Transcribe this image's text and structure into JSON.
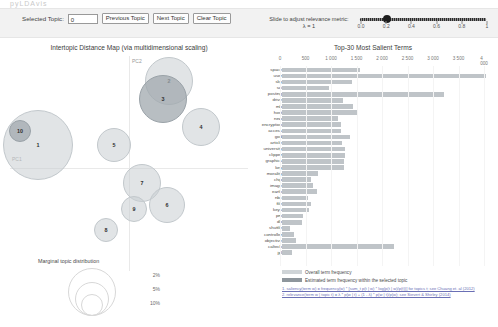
{
  "ghost_text": "pyLDAvis",
  "controls": {
    "selected_topic_label": "Selected Topic:",
    "selected_topic_value": "0",
    "previous_topic": "Previous Topic",
    "next_topic": "Next Topic",
    "clear_topic": "Clear Topic"
  },
  "slider": {
    "label": "Slide to adjust relevance metric:",
    "lambda_label": "λ = 1",
    "value": 1,
    "ticks": [
      "0.0",
      "0.2",
      "0.4",
      "0.6",
      "0.8",
      "1"
    ]
  },
  "left_panel": {
    "title": "Intertopic Distance Map (via multidimensional scaling)",
    "axis_x": "PC1",
    "axis_y": "PC2",
    "topics": [
      {
        "id": "1",
        "x": 27,
        "y": 88,
        "r": 34,
        "selected": false
      },
      {
        "id": "10",
        "x": 9,
        "y": 74,
        "r": 10,
        "selected": true
      },
      {
        "id": "2",
        "x": 158,
        "y": 24,
        "r": 23,
        "selected": false
      },
      {
        "id": "3",
        "x": 152,
        "y": 42,
        "r": 23,
        "selected": true
      },
      {
        "id": "4",
        "x": 190,
        "y": 70,
        "r": 18,
        "selected": false
      },
      {
        "id": "5",
        "x": 103,
        "y": 88,
        "r": 16,
        "selected": false
      },
      {
        "id": "7",
        "x": 131,
        "y": 126,
        "r": 18,
        "selected": false
      },
      {
        "id": "9",
        "x": 123,
        "y": 152,
        "r": 12,
        "selected": false
      },
      {
        "id": "6",
        "x": 156,
        "y": 148,
        "r": 17,
        "selected": false
      },
      {
        "id": "8",
        "x": 95,
        "y": 173,
        "r": 11,
        "selected": false
      }
    ],
    "marginal": {
      "title": "Marginal topic distribution",
      "values": [
        "2%",
        "5%",
        "10%"
      ]
    }
  },
  "right_panel": {
    "title": "Top-30 Most Salient Terms",
    "legend": [
      "Overall term frequency",
      "Estimated term frequency within the selected topic"
    ],
    "notes": [
      "1. saliency(term w) = frequency(w) * [sum_t p(t | w) * log(p(t | w)/p(t))] for topics t; see Chuang et. al (2012)",
      "2. relevance(term w | topic t) = λ * p(w | t) + (1 - λ) * p(w | t)/p(w); see Sievert & Shirley (2014)"
    ]
  },
  "chart_data": {
    "type": "bar",
    "orientation": "horizontal",
    "title": "Top-30 Most Salient Terms",
    "xlabel": "",
    "ylabel": "",
    "xlim": [
      0,
      4000
    ],
    "xticks": [
      0,
      500,
      1000,
      1500,
      2000,
      2500,
      3000,
      3500,
      4000
    ],
    "grid": true,
    "legend_position": "bottom-left",
    "categories": [
      "space",
      "user",
      "sky",
      "sci",
      "posting",
      "drive",
      "mb",
      "host",
      "new",
      "encryption",
      "access",
      "god",
      "article",
      "university",
      "clipper",
      "graphics",
      "key",
      "morality",
      "chip",
      "image",
      "earth",
      "nbc",
      "file",
      "keys",
      "pm",
      "db",
      "shuttle",
      "controller",
      "objective",
      "caltech",
      "jpl"
    ],
    "series": [
      {
        "name": "Overall term frequency",
        "values": [
          1530,
          4000,
          1380,
          930,
          3180,
          1200,
          1390,
          1490,
          1090,
          1160,
          1150,
          1330,
          1170,
          1230,
          1230,
          1220,
          1210,
          700,
          560,
          610,
          690,
          500,
          560,
          520,
          420,
          390,
          150,
          230,
          280,
          2200,
          200
        ]
      },
      {
        "name": "Estimated term frequency within the selected topic",
        "values": [
          0,
          0,
          0,
          0,
          0,
          0,
          0,
          0,
          0,
          0,
          0,
          0,
          0,
          0,
          0,
          0,
          0,
          0,
          0,
          0,
          0,
          0,
          0,
          0,
          0,
          0,
          0,
          0,
          0,
          0,
          0
        ]
      }
    ]
  }
}
